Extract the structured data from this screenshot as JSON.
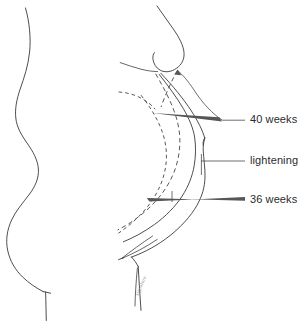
{
  "figure": {
    "background_color": "#ffffff",
    "line_color": "#3a3a3c",
    "text_color": "#2b2b2d",
    "width": 306,
    "height": 327
  },
  "panels": {
    "left": {
      "name": "non-pregnant-profile",
      "description": "Side view body outline without pregnancy"
    },
    "right": {
      "name": "pregnant-profile",
      "description": "Side view body outline with breast and gravid abdomen contours"
    }
  },
  "labels": [
    {
      "id": "forty-weeks",
      "text": "40 weeks",
      "x": 250,
      "y": 120,
      "leader_style": "wedge"
    },
    {
      "id": "lightening",
      "text": "lightening",
      "x": 250,
      "y": 161,
      "leader_style": "line"
    },
    {
      "id": "thirty-six-weeks",
      "text": "36 weeks",
      "x": 250,
      "y": 200,
      "leader_style": "wedge"
    }
  ],
  "contours": [
    {
      "id": "contour-40-weeks",
      "label": "40 weeks",
      "style": "solid",
      "meaning": "Abdominal contour at 40 weeks gestation"
    },
    {
      "id": "contour-lightening",
      "label": "lightening",
      "style": "solid",
      "meaning": "Abdominal contour after fetal descent into pelvis"
    },
    {
      "id": "contour-36-weeks",
      "label": "36 weeks",
      "style": "dashed",
      "meaning": "Abdominal contour at 36 weeks gestation"
    },
    {
      "id": "contour-inner-dashed",
      "label": "",
      "style": "dashed",
      "meaning": "Inner reference contour"
    }
  ],
  "signature": {
    "text": "signature",
    "visible": true
  }
}
